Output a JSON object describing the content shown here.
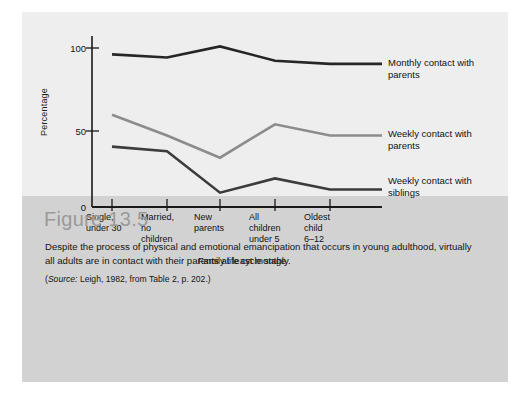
{
  "figure": {
    "number_label": "Figure 13.5",
    "description": "Despite the process of physical and emotional emancipation that occurs in young adulthood, virtually all adults are in contact with their parents at least monthly.",
    "source_prefix": "Source:",
    "source_text": " Leigh, 1982, from Table 2, p. 202.)",
    "source_open_paren": "("
  },
  "chart_data": {
    "type": "line",
    "title": "",
    "xlabel": "Family life cycle stage",
    "ylabel": "Percentage",
    "categories": [
      "Single, under 30",
      "Married, no children",
      "New parents",
      "All children under 5",
      "Oldest child 6–12"
    ],
    "category_lines": [
      [
        "Single,",
        "under 30"
      ],
      [
        "Married,",
        "no",
        "children"
      ],
      [
        "New",
        "parents"
      ],
      [
        "All",
        "children",
        "under 5"
      ],
      [
        "Oldest",
        "child",
        "6–12"
      ]
    ],
    "ylim": [
      0,
      110
    ],
    "yticks": [
      0,
      50,
      100
    ],
    "ytick_labels": [
      "0",
      "50",
      "100"
    ],
    "grid": false,
    "legend_position": "right-inline",
    "series": [
      {
        "name": "Monthly contact with parents",
        "label_lines": [
          "Monthly contact with",
          "parents"
        ],
        "color": "#262626",
        "values": [
          96,
          94,
          101,
          92,
          90
        ]
      },
      {
        "name": "Weekly contact with parents",
        "label_lines": [
          "Weekly contact with",
          "parents"
        ],
        "color": "#8c8c8c",
        "values": [
          58,
          45,
          31,
          52,
          45
        ]
      },
      {
        "name": "Weekly contact with siblings",
        "label_lines": [
          "Weekly contact with",
          "siblings"
        ],
        "color": "#3c3c3c",
        "values": [
          38,
          35,
          9,
          18,
          11
        ]
      }
    ]
  }
}
